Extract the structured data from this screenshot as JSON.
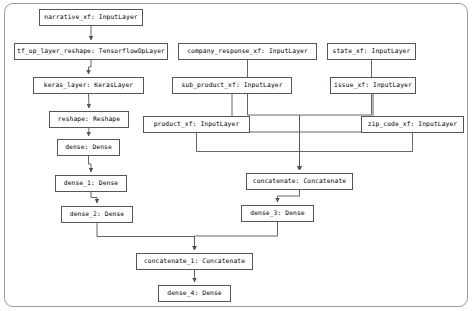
{
  "diagram": {
    "type": "directed-graph",
    "nodes": [
      {
        "id": "narrative_xf",
        "label": "narrative_xf: InputLayer",
        "x": 39,
        "y": 9,
        "w": 104,
        "h": 17
      },
      {
        "id": "tf_op_layer_reshape",
        "label": "tf_op_layer_reshape: TensorflowOpLayer",
        "x": 14,
        "y": 43,
        "w": 154,
        "h": 17
      },
      {
        "id": "keras_layer",
        "label": "keras_layer: KerasLayer",
        "x": 33,
        "y": 77,
        "w": 111,
        "h": 17
      },
      {
        "id": "reshape",
        "label": "reshape: Reshape",
        "x": 49,
        "y": 111,
        "w": 80,
        "h": 17
      },
      {
        "id": "dense",
        "label": "dense: Dense",
        "x": 57,
        "y": 139,
        "w": 63,
        "h": 17
      },
      {
        "id": "dense_1",
        "label": "dense_1: Dense",
        "x": 55,
        "y": 175,
        "w": 72,
        "h": 17
      },
      {
        "id": "dense_2",
        "label": "dense_2: Dense",
        "x": 61,
        "y": 206,
        "w": 72,
        "h": 17
      },
      {
        "id": "company_response_xf",
        "label": "company_response_xf: InputLayer",
        "x": 178,
        "y": 43,
        "w": 139,
        "h": 17
      },
      {
        "id": "state_xf",
        "label": "state_xf: InputLayer",
        "x": 327,
        "y": 43,
        "w": 89,
        "h": 17
      },
      {
        "id": "sub_product_xf",
        "label": "sub_product_xf: InputLayer",
        "x": 172,
        "y": 77,
        "w": 120,
        "h": 17
      },
      {
        "id": "issue_xf",
        "label": "issue_xf: InputLayer",
        "x": 330,
        "y": 77,
        "w": 86,
        "h": 17
      },
      {
        "id": "product_xf",
        "label": "product_xf: InputLayer",
        "x": 143,
        "y": 116,
        "w": 107,
        "h": 17
      },
      {
        "id": "zip_code_xf",
        "label": "zip_code_xf: InputLayer",
        "x": 361,
        "y": 116,
        "w": 103,
        "h": 17
      },
      {
        "id": "concatenate",
        "label": "concatenate: Concatenate",
        "x": 246,
        "y": 173,
        "w": 107,
        "h": 17
      },
      {
        "id": "dense_3",
        "label": "dense_3: Dense",
        "x": 241,
        "y": 205,
        "w": 73,
        "h": 17
      },
      {
        "id": "concatenate_1",
        "label": "concatenate_1: Concatenate",
        "x": 136,
        "y": 253,
        "w": 117,
        "h": 17
      },
      {
        "id": "dense_4",
        "label": "dense_4: Dense",
        "x": 158,
        "y": 285,
        "w": 73,
        "h": 17
      }
    ],
    "edges": [
      [
        "narrative_xf",
        "tf_op_layer_reshape"
      ],
      [
        "tf_op_layer_reshape",
        "keras_layer"
      ],
      [
        "keras_layer",
        "reshape"
      ],
      [
        "reshape",
        "dense"
      ],
      [
        "dense",
        "dense_1"
      ],
      [
        "dense_1",
        "dense_2"
      ],
      [
        "dense_2",
        "concatenate_1"
      ],
      [
        "company_response_xf",
        "concatenate"
      ],
      [
        "state_xf",
        "concatenate"
      ],
      [
        "sub_product_xf",
        "concatenate"
      ],
      [
        "issue_xf",
        "concatenate"
      ],
      [
        "product_xf",
        "concatenate"
      ],
      [
        "zip_code_xf",
        "concatenate"
      ],
      [
        "concatenate",
        "dense_3"
      ],
      [
        "dense_3",
        "concatenate_1"
      ],
      [
        "concatenate_1",
        "dense_4"
      ]
    ]
  }
}
